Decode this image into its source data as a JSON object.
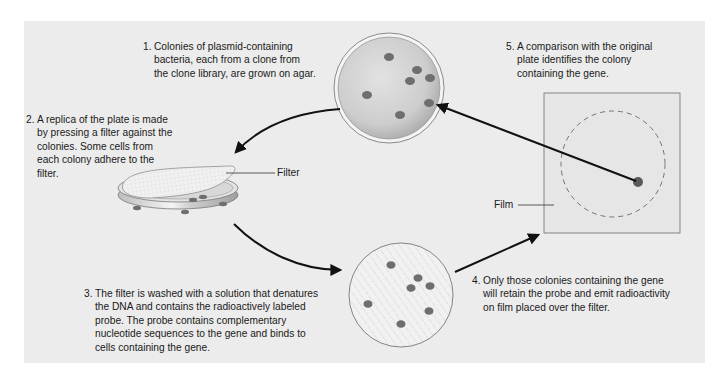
{
  "diagram": {
    "steps": [
      {
        "number": "1.",
        "text": "Colonies of plasmid-containing\nbacteria, each from a clone from\nthe clone library, are grown on agar."
      },
      {
        "number": "2.",
        "text": "A replica of the plate is made\nby  pressing a filter against the\ncolonies. Some cells from\neach colony adhere to the\nfilter."
      },
      {
        "number": "3.",
        "text": "The filter is washed with a solution that denatures\nthe DNA and contains the radioactively labeled\nprobe. The probe contains complementary\nnucleotide sequences to the gene and binds to\ncells containing the gene."
      },
      {
        "number": "4.",
        "text": "Only those colonies containing the gene\nwill retain the probe and emit radioactivity\non film placed over the filter."
      },
      {
        "number": "5.",
        "text": "A comparison with the original\nplate identifies the colony\ncontaining the gene."
      }
    ],
    "labels": {
      "filter": "Filter",
      "film": "Film"
    },
    "objects": [
      {
        "id": "agar-plate",
        "colonies": 7
      },
      {
        "id": "replica-filter-dish",
        "colonies": 5
      },
      {
        "id": "probed-filter",
        "colonies": 7
      },
      {
        "id": "x-ray-film",
        "spots": 1
      }
    ],
    "colors": {
      "panel": "#ececec",
      "colony": "#6e6e6e",
      "arrow": "#111111",
      "agar": "#c9c9c9",
      "film": "#e6e6e6"
    }
  }
}
